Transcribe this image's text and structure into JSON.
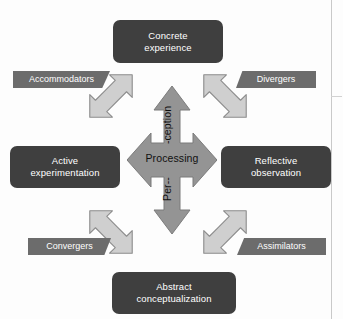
{
  "diagram": {
    "colors": {
      "stage_box": "#3f3f3f",
      "stage_text": "#ffffff",
      "style_label": "#6c6c6c",
      "cross_arrow_fill": "#949494",
      "cross_arrow_stroke": "#7b7b7b",
      "diagonal_arrow_fill": "#cfcfcf",
      "diagonal_arrow_stroke": "#8c8c8c",
      "background": "#fdfdfd",
      "axis_text": "#111111"
    },
    "stages": [
      {
        "id": "concrete-experience",
        "position": "top",
        "line1": "Concrete",
        "line2": "experience"
      },
      {
        "id": "active-experimentation",
        "position": "left",
        "line1": "Active",
        "line2": "experimentation"
      },
      {
        "id": "reflective-observation",
        "position": "right",
        "line1": "Reflective",
        "line2": "observation"
      },
      {
        "id": "abstract-conceptualization",
        "position": "bottom",
        "line1": "Abstract",
        "line2": "conceptualization"
      }
    ],
    "learning_styles": [
      {
        "id": "accommodators",
        "position": "top-left",
        "label": "Accommodators"
      },
      {
        "id": "divergers",
        "position": "top-right",
        "label": "Divergers"
      },
      {
        "id": "convergers",
        "position": "bottom-left",
        "label": "Convergers"
      },
      {
        "id": "assimilators",
        "position": "bottom-right",
        "label": "Assimilators"
      }
    ],
    "axes": {
      "horizontal_label": "Processing",
      "vertical_label_upper": "-ception",
      "vertical_label_lower": "Per--",
      "vertical_label_full": "Per--ception"
    },
    "arrows": {
      "cross": "four-headed-cross-arrow",
      "diagonals": [
        "diagonal-arrow-top-left",
        "diagonal-arrow-top-right",
        "diagonal-arrow-bottom-left",
        "diagonal-arrow-bottom-right"
      ]
    }
  }
}
